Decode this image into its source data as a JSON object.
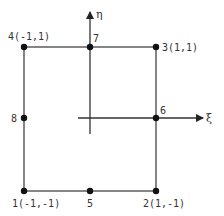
{
  "diagram": {
    "type": "finite-element-node-layout",
    "colors": {
      "line": "#333333",
      "node": "#111111",
      "background": "#ffffff"
    },
    "axes": {
      "xi": {
        "label": "ξ"
      },
      "eta": {
        "label": "η"
      }
    },
    "nodes": [
      {
        "id": "1",
        "label": "1(-1,-1)"
      },
      {
        "id": "2",
        "label": "2(1,-1)"
      },
      {
        "id": "3",
        "label": "3(1,1)"
      },
      {
        "id": "4",
        "label": "4(-1,1)"
      },
      {
        "id": "5",
        "label": "5"
      },
      {
        "id": "6",
        "label": "6"
      },
      {
        "id": "7",
        "label": "7"
      },
      {
        "id": "8",
        "label": "8"
      }
    ]
  }
}
